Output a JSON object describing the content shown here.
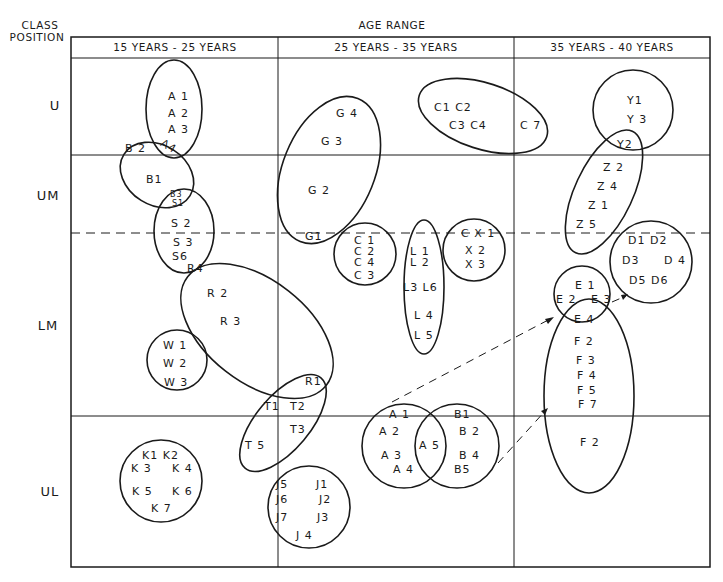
{
  "diagram": {
    "y_axis_title_line1": "CLASS",
    "y_axis_title_line2": "POSITION",
    "x_axis_title": "AGE RANGE",
    "columns": [
      "15 YEARS - 25 YEARS",
      "25 YEARS - 35 YEARS",
      "35 YEARS - 40 YEARS"
    ],
    "rows": [
      "U",
      "UM",
      "LM",
      "UL"
    ],
    "colors": {
      "ink": "#1a1a1a",
      "background": "#ffffff"
    },
    "groups": {
      "A_top": [
        "A 1",
        "A 2",
        "A 3",
        "A4"
      ],
      "B_top": [
        "B 2",
        "B1",
        "B3",
        "S1"
      ],
      "S": [
        "S 2",
        "S 3",
        "S6",
        "R4"
      ],
      "R": [
        "R 2",
        "R 3",
        "R1"
      ],
      "W": [
        "W 1",
        "W 2",
        "W 3"
      ],
      "T": [
        "T1",
        "T2",
        "T3",
        "T 5"
      ],
      "K": [
        "K1 K2",
        "K 3",
        "K 4",
        "K 5",
        "K 6",
        "K 7"
      ],
      "J": [
        "J5",
        "J1",
        "J6",
        "J2",
        "J7",
        "J3",
        "J 4"
      ],
      "G": [
        "G 4",
        "G 3",
        "G 2",
        "G1"
      ],
      "C_top": [
        "C1  C2",
        "C3  C4",
        "C 7"
      ],
      "C_mid": [
        "C 1",
        "C 2",
        "C 4",
        "C 3"
      ],
      "L": [
        "L 1",
        "L 2",
        "L3 L6",
        "L 4",
        "L 5"
      ],
      "X": [
        "C X 1",
        "X 2",
        "X 3"
      ],
      "A_bottom": [
        "A 1",
        "A 2",
        "A 3",
        "A 4",
        "A 5"
      ],
      "B_bottom": [
        "B1",
        "B 2",
        "B 4",
        "B5"
      ],
      "Y": [
        "Y1",
        "Y 3",
        "Y2"
      ],
      "Z": [
        "Z 2",
        "Z 4",
        "Z 1",
        "Z 5"
      ],
      "D": [
        "D1  D2",
        "D3",
        "D 4",
        "D5 D6"
      ],
      "E": [
        "E 1",
        "E 2",
        "E 3",
        "E 4"
      ],
      "F": [
        "F 2",
        "F 3",
        "F 4",
        "F 5",
        "F 7",
        "F 2"
      ]
    }
  }
}
